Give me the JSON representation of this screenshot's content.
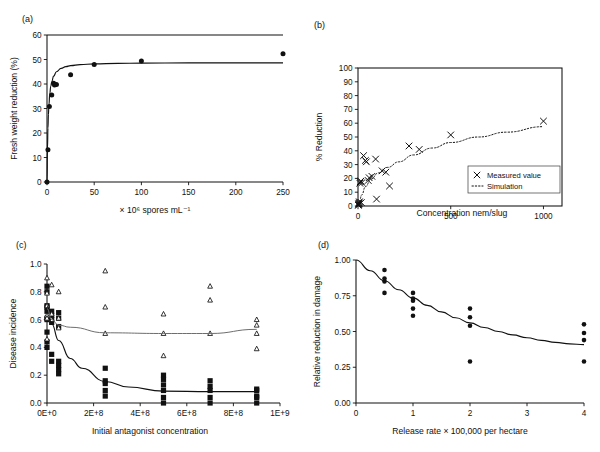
{
  "figure": {
    "panel_labels": {
      "a": "(a)",
      "b": "(b)",
      "c": "(c)",
      "d": "(d)"
    }
  },
  "chart_data": [
    {
      "id": "a",
      "panel_label": "(a)",
      "type": "scatter",
      "title": "",
      "xlabel": "× 10⁶ spores mL⁻¹",
      "ylabel": "Fresh weight reduction (%)",
      "xlim": [
        0,
        250
      ],
      "ylim": [
        0,
        60
      ],
      "xticks": [
        0,
        50,
        100,
        150,
        200,
        250
      ],
      "xticklabels": [
        "0",
        "50",
        "100",
        "150",
        "200",
        "250"
      ],
      "yticks": [
        0,
        10,
        20,
        30,
        40,
        50,
        60
      ],
      "yticklabels": [
        "0",
        "10",
        "20",
        "30",
        "40",
        "50",
        "60"
      ],
      "grid": false,
      "legend": "none",
      "series": [
        {
          "name": "Measured points",
          "marker": "filled-circle",
          "x": [
            0,
            1,
            2.5,
            5,
            7,
            8,
            10,
            25,
            50,
            100,
            250
          ],
          "y": [
            0,
            13.2,
            30.8,
            35.5,
            40.3,
            39.6,
            39.8,
            43.8,
            48.0,
            49.4,
            52.3
          ]
        },
        {
          "name": "Fitted saturation curve",
          "marker": "line",
          "x": [
            0,
            0.5,
            1,
            1.5,
            2,
            3,
            4,
            5,
            7,
            10,
            15,
            20,
            25,
            35,
            50,
            75,
            100,
            150,
            200,
            250
          ],
          "y": [
            0,
            13.5,
            22.0,
            27.5,
            31.4,
            36.3,
            39.1,
            40.9,
            43.2,
            45.0,
            46.4,
            47.1,
            47.5,
            47.9,
            48.2,
            48.4,
            48.5,
            48.6,
            48.6,
            48.6
          ]
        }
      ]
    },
    {
      "id": "b",
      "panel_label": "(b)",
      "type": "scatter",
      "title": "",
      "xlabel": "Concentration nem/slug",
      "ylabel": "% Reduction",
      "xlim": [
        0,
        1100
      ],
      "ylim": [
        0,
        100
      ],
      "xticks": [
        0,
        500,
        1000
      ],
      "xticklabels": [
        "0",
        "500",
        "1000"
      ],
      "yticks": [
        0,
        10,
        20,
        30,
        40,
        50,
        60,
        70,
        80,
        90,
        100
      ],
      "yticklabels": [
        "0",
        "10",
        "20",
        "30",
        "40",
        "50",
        "60",
        "70",
        "80",
        "90",
        "100"
      ],
      "grid": false,
      "legend": "inside-lower-right",
      "legend_items": [
        {
          "label": "Measured value",
          "marker": "cross"
        },
        {
          "label": "Simulation",
          "marker": "dotted-line"
        }
      ],
      "series": [
        {
          "name": "Measured value",
          "marker": "cross",
          "x": [
            2,
            3,
            4,
            5,
            6,
            8,
            10,
            12,
            15,
            18,
            22,
            30,
            40,
            45,
            55,
            60,
            75,
            95,
            100,
            130,
            150,
            170,
            275,
            330,
            500,
            1000
          ],
          "y": [
            0.5,
            1.0,
            1.5,
            2.0,
            2.5,
            3.0,
            16.5,
            17.5,
            18.0,
            2.5,
            17.0,
            36.5,
            33.0,
            32.0,
            18.5,
            20.5,
            21.5,
            34.0,
            5.0,
            25.5,
            24.5,
            14.5,
            43.5,
            41.0,
            51.5,
            61.5
          ]
        },
        {
          "name": "Simulation",
          "marker": "dotted-line",
          "x": [
            5,
            20,
            40,
            70,
            110,
            160,
            220,
            300,
            400,
            500,
            650,
            800,
            1000
          ],
          "y": [
            1.0,
            8.0,
            14.0,
            19.5,
            24.0,
            28.0,
            32.0,
            37.0,
            42.0,
            46.0,
            50.0,
            53.5,
            57.5
          ]
        }
      ]
    },
    {
      "id": "c",
      "panel_label": "(c)",
      "type": "scatter",
      "title": "",
      "xlabel": "Initial antagonist concentration",
      "ylabel": "Disease incidence",
      "xlim": [
        0,
        1000000000
      ],
      "ylim": [
        0,
        1.0
      ],
      "xticks": [
        0,
        200000000,
        400000000,
        600000000,
        800000000,
        1000000000
      ],
      "xticklabels": [
        "0E+0",
        "2E+8",
        "4E+8",
        "6E+8",
        "8E+8",
        "1E+9"
      ],
      "yticks": [
        0,
        0.2,
        0.4,
        0.6,
        0.8,
        1.0
      ],
      "yticklabels": [
        "0.0",
        "0.2",
        "0.4",
        "0.6",
        "0.8",
        "1.0"
      ],
      "grid": false,
      "legend": "none",
      "series": [
        {
          "name": "Treated (filled squares)",
          "marker": "filled-square",
          "x": [
            0,
            0,
            0,
            0,
            0,
            0,
            0,
            0,
            0,
            0,
            20000000,
            20000000,
            20000000,
            20000000,
            20000000,
            20000000,
            50000000,
            50000000,
            50000000,
            50000000,
            50000000,
            50000000,
            50000000,
            250000000,
            250000000,
            250000000,
            250000000,
            250000000,
            500000000,
            500000000,
            500000000,
            500000000,
            500000000,
            500000000,
            700000000,
            700000000,
            700000000,
            700000000,
            700000000,
            900000000,
            900000000,
            900000000,
            900000000,
            900000000
          ],
          "y": [
            0.84,
            0.8,
            0.7,
            0.69,
            0.66,
            0.61,
            0.6,
            0.51,
            0.44,
            0.4,
            0.66,
            0.63,
            0.6,
            0.58,
            0.35,
            0.3,
            0.65,
            0.61,
            0.55,
            0.3,
            0.27,
            0.24,
            0.21,
            0.25,
            0.16,
            0.14,
            0.09,
            0.05,
            0.2,
            0.17,
            0.13,
            0.09,
            0.04,
            0.0,
            0.16,
            0.12,
            0.09,
            0.04,
            0.0,
            0.1,
            0.09,
            0.05,
            0.04,
            0.0
          ]
        },
        {
          "name": "Control (open triangles)",
          "marker": "open-triangle",
          "x": [
            0,
            0,
            0,
            0,
            0,
            0,
            20000000,
            20000000,
            20000000,
            50000000,
            50000000,
            50000000,
            250000000,
            250000000,
            250000000,
            500000000,
            500000000,
            500000000,
            700000000,
            700000000,
            700000000,
            900000000,
            900000000,
            900000000,
            900000000
          ],
          "y": [
            0.9,
            0.79,
            0.7,
            0.63,
            0.61,
            0.46,
            0.85,
            0.64,
            0.6,
            0.8,
            0.61,
            0.54,
            0.95,
            0.69,
            0.5,
            0.64,
            0.5,
            0.34,
            0.84,
            0.74,
            0.5,
            0.39,
            0.6,
            0.56,
            0.5,
            0.34
          ]
        },
        {
          "name": "Treated fitted curve",
          "marker": "line",
          "x": [
            0,
            20000000,
            50000000,
            100000000,
            150000000,
            250000000,
            350000000,
            500000000,
            700000000,
            900000000
          ],
          "y": [
            0.7,
            0.57,
            0.45,
            0.32,
            0.25,
            0.155,
            0.115,
            0.085,
            0.082,
            0.082
          ]
        },
        {
          "name": "Control fitted curve",
          "marker": "line-grey",
          "x": [
            0,
            20000000,
            50000000,
            100000000,
            250000000,
            500000000,
            700000000,
            900000000
          ],
          "y": [
            0.68,
            0.6,
            0.56,
            0.545,
            0.505,
            0.5,
            0.5,
            0.53
          ]
        }
      ]
    },
    {
      "id": "d",
      "panel_label": "(d)",
      "type": "scatter",
      "title": "",
      "xlabel": "Release rate × 100,000 per hectare",
      "ylabel": "Relative reduction in damage",
      "xlim": [
        0,
        4
      ],
      "ylim": [
        0,
        1.0
      ],
      "xticks": [
        0,
        1,
        2,
        3,
        4
      ],
      "xticklabels": [
        "0",
        "1",
        "2",
        "3",
        "4"
      ],
      "yticks": [
        0,
        0.25,
        0.5,
        0.75,
        1.0
      ],
      "yticklabels": [
        "0.00",
        "0.25",
        "0.50",
        "0.75",
        "1.00"
      ],
      "grid": false,
      "legend": "none",
      "series": [
        {
          "name": "Observed",
          "marker": "filled-circle",
          "x": [
            0.5,
            0.5,
            0.5,
            0.5,
            1,
            1,
            1,
            1,
            1,
            2,
            2,
            2,
            2,
            4,
            4,
            4,
            4
          ],
          "y": [
            0.93,
            0.87,
            0.85,
            0.77,
            0.77,
            0.73,
            0.715,
            0.66,
            0.61,
            0.66,
            0.6,
            0.54,
            0.29,
            0.55,
            0.49,
            0.44,
            0.29
          ]
        },
        {
          "name": "Fitted decay curve",
          "marker": "line",
          "x": [
            0,
            0.25,
            0.5,
            0.75,
            1,
            1.25,
            1.5,
            1.75,
            2,
            2.25,
            2.5,
            2.75,
            3,
            3.25,
            3.5,
            3.75,
            4
          ],
          "y": [
            1.0,
            0.925,
            0.855,
            0.792,
            0.735,
            0.683,
            0.637,
            0.596,
            0.56,
            0.528,
            0.5,
            0.476,
            0.456,
            0.438,
            0.424,
            0.414,
            0.408
          ]
        }
      ]
    }
  ]
}
